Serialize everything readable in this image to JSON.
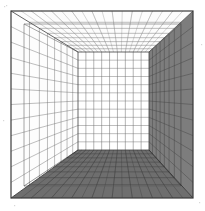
{
  "figure": {
    "type": "line-drawing",
    "background_color": "#ffffff",
    "canvas": {
      "width": 205,
      "height": 211
    }
  },
  "frame": {
    "name": "outer-picture-frame",
    "x0": 11,
    "y0": 11,
    "x1": 193,
    "y1": 198,
    "stroke": "#3a3a3a",
    "stroke_width": 1.2
  },
  "geometry": {
    "vanishing_point": {
      "x": 113,
      "y": 100
    },
    "back_wall": {
      "x0": 78,
      "y0": 52,
      "x1": 149,
      "y1": 150
    },
    "inner_offset_box": {
      "x0": 24,
      "y0": 24,
      "x1": 181,
      "y1": 186
    },
    "divisions": {
      "back_wall_columns": 9,
      "back_wall_rows": 12,
      "depth_steps": 8,
      "ceiling_rays": 18,
      "floor_rays": 18,
      "side_wall_rays": 12
    }
  },
  "surfaces": [
    {
      "name": "ceiling",
      "label": "Ceiling",
      "fill": "#fbfbfb",
      "grid_stroke": "#8a8a8a",
      "shaded": false
    },
    {
      "name": "left-wall",
      "label": "Left Wall",
      "fill": "#fdfdfd",
      "grid_stroke": "#6f6f6f",
      "shaded": false
    },
    {
      "name": "back-wall",
      "label": "Back Wall",
      "fill": "#ffffff",
      "grid_stroke": "#787878",
      "shaded": false
    },
    {
      "name": "right-wall",
      "label": "Right Wall",
      "fill": "#7d7d7d",
      "grid_stroke": "#4a4a4a",
      "shaded": true
    },
    {
      "name": "floor",
      "label": "Floor",
      "fill": "#6e6e6e",
      "grid_stroke": "#3f3f3f",
      "shaded": true
    }
  ],
  "colors": {
    "frame_line": "#3a3a3a",
    "light_grid": "#9a9a9a",
    "mid_grid": "#6f6f6f",
    "dark_grid": "#3f3f3f",
    "right_wall_fill": "#7d7d7d",
    "floor_fill": "#6e6e6e",
    "paper": "#ffffff",
    "speck": "#cbcbcb"
  },
  "artifacts": {
    "specks": [
      {
        "x": 4,
        "y": 6
      },
      {
        "x": 6,
        "y": 5
      },
      {
        "x": 201,
        "y": 44
      },
      {
        "x": 199,
        "y": 202
      },
      {
        "x": 14,
        "y": 205
      },
      {
        "x": 3,
        "y": 120
      }
    ]
  }
}
